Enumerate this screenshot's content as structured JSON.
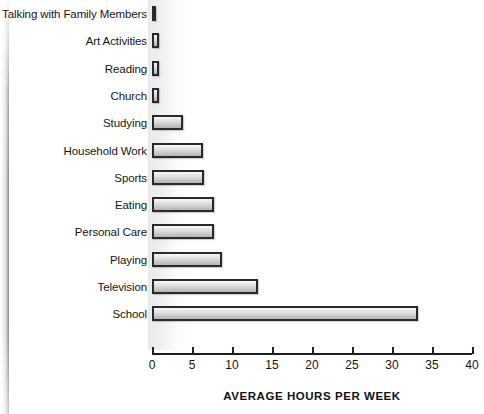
{
  "chart_data": {
    "type": "bar",
    "orientation": "horizontal",
    "title": "",
    "xlabel": "AVERAGE HOURS PER WEEK",
    "ylabel": "",
    "xlim": [
      0,
      40
    ],
    "xticks": [
      0,
      5,
      10,
      15,
      20,
      25,
      30,
      35,
      40
    ],
    "xtick_labels": [
      "0",
      "5",
      "10",
      "15",
      "20",
      "25",
      "30",
      "35",
      "40"
    ],
    "grid": false,
    "legend": false,
    "categories": [
      "Talking with Family Members",
      "Art Activities",
      "Reading",
      "Church",
      "Studying",
      "Household Work",
      "Sports",
      "Eating",
      "Personal Care",
      "Playing",
      "Television",
      "School"
    ],
    "values": [
      0.5,
      0.9,
      0.9,
      0.9,
      3.9,
      6.4,
      6.5,
      7.7,
      7.8,
      8.8,
      13.2,
      33.3
    ],
    "bars": [
      {
        "label": "Talking with Family Members",
        "value": 0.5
      },
      {
        "label": "Art Activities",
        "value": 0.9
      },
      {
        "label": "Reading",
        "value": 0.9
      },
      {
        "label": "Church",
        "value": 0.9
      },
      {
        "label": "Studying",
        "value": 3.9
      },
      {
        "label": "Household Work",
        "value": 6.4
      },
      {
        "label": "Sports",
        "value": 6.5
      },
      {
        "label": "Eating",
        "value": 7.7
      },
      {
        "label": "Personal Care",
        "value": 7.8
      },
      {
        "label": "Playing",
        "value": 8.8
      },
      {
        "label": "Television",
        "value": 13.2
      },
      {
        "label": "School",
        "value": 33.3
      }
    ],
    "colors": {
      "bar_fill_light": "#f2f2f2",
      "bar_fill_dark": "#b4b4b4",
      "bar_outline": "#2a2a2a",
      "axis": "#1f1f1f",
      "text": "#161616",
      "background": "#ffffff"
    }
  }
}
